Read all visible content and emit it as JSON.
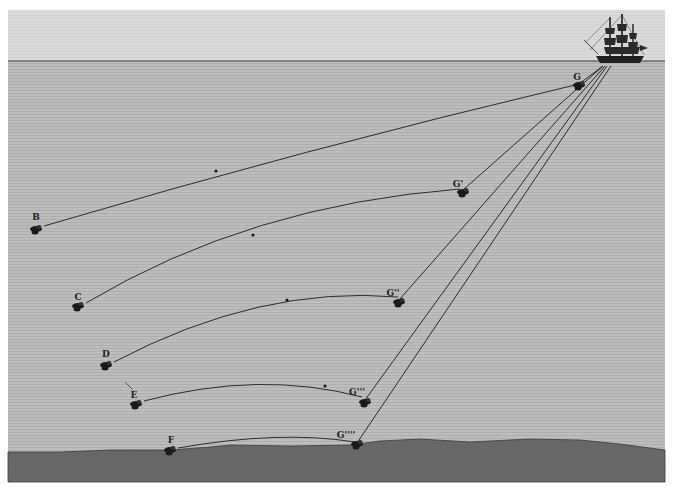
{
  "figure": {
    "frame": {
      "x": 8,
      "y": 10,
      "w": 657,
      "h": 472
    },
    "horizon_y": 61,
    "colors": {
      "sky": "#d6d6d6",
      "water": "#b9b9b9",
      "seabed": "#6e6e6e",
      "line": "#1c1c1c",
      "ink": "#1a1a1a",
      "page": "#ffffff"
    },
    "ship": {
      "name": "three-masted ship",
      "x": 600,
      "y": 60
    }
  },
  "labels": [
    {
      "id": "B",
      "text": "B",
      "x": 36,
      "y": 220
    },
    {
      "id": "C",
      "text": "C",
      "x": 78,
      "y": 300
    },
    {
      "id": "D",
      "text": "D",
      "x": 106,
      "y": 357
    },
    {
      "id": "E",
      "text": "E",
      "x": 134,
      "y": 398
    },
    {
      "id": "F",
      "text": "F",
      "x": 171,
      "y": 443
    },
    {
      "id": "G",
      "text": "G",
      "x": 577,
      "y": 80
    },
    {
      "id": "G1",
      "text": "G'",
      "x": 458,
      "y": 187
    },
    {
      "id": "G2",
      "text": "G''",
      "x": 393,
      "y": 296
    },
    {
      "id": "G3",
      "text": "G'''",
      "x": 357,
      "y": 395
    },
    {
      "id": "G4",
      "text": "G''''",
      "x": 346,
      "y": 438
    }
  ],
  "weights": [
    {
      "id": "B",
      "x": 36,
      "y": 229
    },
    {
      "id": "C",
      "x": 78,
      "y": 306
    },
    {
      "id": "D",
      "x": 106,
      "y": 365
    },
    {
      "id": "E",
      "x": 136,
      "y": 404
    },
    {
      "id": "F",
      "x": 170,
      "y": 450
    },
    {
      "id": "G",
      "x": 579,
      "y": 85
    },
    {
      "id": "G1",
      "x": 463,
      "y": 192
    },
    {
      "id": "G2",
      "x": 399,
      "y": 302
    },
    {
      "id": "G3",
      "x": 365,
      "y": 402
    },
    {
      "id": "G4",
      "x": 357,
      "y": 444
    }
  ],
  "sounding_lines": [
    {
      "from": "B",
      "path": "M44,226 Q300,150 579,84",
      "marker": {
        "x": 216,
        "y": 171
      }
    },
    {
      "from": "C",
      "path": "M86,303 Q250,205 460,189",
      "marker": {
        "x": 253,
        "y": 235
      }
    },
    {
      "from": "D",
      "path": "M114,362 Q260,285 398,297",
      "marker": {
        "x": 287,
        "y": 300
      }
    },
    {
      "from": "E",
      "path": "M144,401 Q260,370 362,397",
      "marker": {
        "x": 325,
        "y": 386
      }
    },
    {
      "from": "F",
      "path": "M178,448 Q280,430 355,442",
      "marker": null
    }
  ],
  "ship_lines": [
    {
      "to": "G",
      "x1": 603,
      "y1": 66,
      "x2": 579,
      "y2": 84
    },
    {
      "to": "G1",
      "x1": 603,
      "y1": 66,
      "x2": 463,
      "y2": 190
    },
    {
      "to": "G2",
      "x1": 605,
      "y1": 66,
      "x2": 399,
      "y2": 300
    },
    {
      "to": "G3",
      "x1": 607,
      "y1": 66,
      "x2": 365,
      "y2": 400
    },
    {
      "to": "G4",
      "x1": 611,
      "y1": 66,
      "x2": 357,
      "y2": 443
    }
  ],
  "seabed_path": "M8,452 L60,452 L110,450 L170,450 L210,447 L230,445 L290,446 L350,445 L380,441 L420,439 L470,442 L530,439 L580,440 L620,444 L665,450 L665,482 L8,482 Z"
}
